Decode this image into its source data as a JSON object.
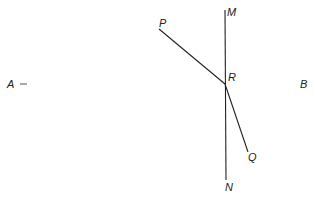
{
  "diagram": {
    "points": {
      "A": {
        "label": "A"
      },
      "B": {
        "label": "B"
      },
      "M": {
        "label": "M"
      },
      "N": {
        "label": "N"
      },
      "P": {
        "label": "P"
      },
      "Q": {
        "label": "Q"
      },
      "R": {
        "label": "R"
      }
    },
    "segments": [
      "AB",
      "MN",
      "RP",
      "RQ"
    ],
    "colors": {
      "line": "#222222",
      "ab_start": "#3c9a4a",
      "ab_mid": "#b25a5a",
      "ab_end": "#555555"
    }
  }
}
